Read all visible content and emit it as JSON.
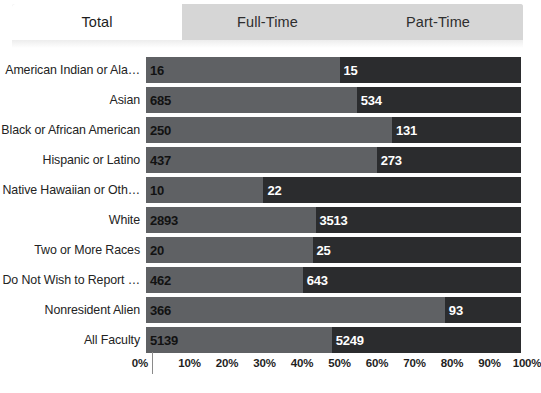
{
  "tabs": [
    {
      "label": "Total",
      "active": true
    },
    {
      "label": "Full-Time",
      "active": false
    },
    {
      "label": "Part-Time",
      "active": false
    }
  ],
  "colors": {
    "segment_full_time": "#5f6164",
    "segment_part_time": "#2b2c2e",
    "tab_active_bg": "#ffffff",
    "tab_inactive_bg": "#d6d6d6"
  },
  "chart_data": {
    "type": "bar",
    "title": "",
    "xlabel": "",
    "ylabel": "",
    "stacked": true,
    "normalized": true,
    "orientation": "horizontal",
    "grid": false,
    "legend": "none",
    "xlim": [
      0,
      100
    ],
    "xticks": [
      "0%",
      "10%",
      "20%",
      "30%",
      "40%",
      "50%",
      "60%",
      "70%",
      "80%",
      "90%",
      "100%"
    ],
    "categories": [
      "American Indian or Ala…",
      "Asian",
      "Black or African American",
      "Hispanic or Latino",
      "Native Hawaiian or Oth…",
      "White",
      "Two or More Races",
      "Do Not Wish to Report …",
      "Nonresident Alien",
      "All Faculty"
    ],
    "series": [
      {
        "name": "Full-Time",
        "values": [
          16,
          685,
          250,
          437,
          10,
          2893,
          20,
          462,
          366,
          5139
        ]
      },
      {
        "name": "Part-Time",
        "values": [
          15,
          534,
          131,
          273,
          22,
          3513,
          25,
          643,
          93,
          5249
        ]
      }
    ],
    "rows": [
      {
        "category": "American Indian or Ala…",
        "full_time": 16,
        "part_time": 15,
        "full_pct": 51.6
      },
      {
        "category": "Asian",
        "full_time": 685,
        "part_time": 534,
        "full_pct": 56.2
      },
      {
        "category": "Black or African American",
        "full_time": 250,
        "part_time": 131,
        "full_pct": 65.6
      },
      {
        "category": "Hispanic or Latino",
        "full_time": 437,
        "part_time": 273,
        "full_pct": 61.5
      },
      {
        "category": "Native Hawaiian or Oth…",
        "full_time": 10,
        "part_time": 22,
        "full_pct": 31.3
      },
      {
        "category": "White",
        "full_time": 2893,
        "part_time": 3513,
        "full_pct": 45.2
      },
      {
        "category": "Two or More Races",
        "full_time": 20,
        "part_time": 25,
        "full_pct": 44.4
      },
      {
        "category": "Do Not Wish to Report …",
        "full_time": 462,
        "part_time": 643,
        "full_pct": 41.8
      },
      {
        "category": "Nonresident Alien",
        "full_time": 366,
        "part_time": 93,
        "full_pct": 79.7
      },
      {
        "category": "All Faculty",
        "full_time": 5139,
        "part_time": 5249,
        "full_pct": 49.5
      }
    ]
  }
}
